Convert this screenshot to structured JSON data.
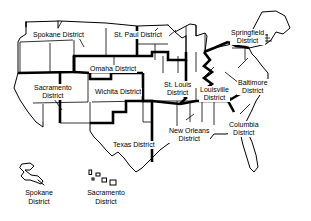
{
  "map": {
    "title": "US Army Corps of Engineers District Map",
    "colors": {
      "outline": "#000000",
      "district_boundary": "#000000",
      "state_boundary": "#000000",
      "background": "#ffffff"
    },
    "districts": [
      {
        "id": "spokane",
        "name": "Spokane District",
        "label_lines": [
          "Spokane District"
        ],
        "label_x": 32,
        "label_y": 31,
        "leader": true
      },
      {
        "id": "st-paul",
        "name": "St. Paul District",
        "label_lines": [
          "St. Paul District"
        ],
        "label_x": 113,
        "label_y": 31,
        "leader": true
      },
      {
        "id": "springfield",
        "name": "Springfield District",
        "label_lines": [
          "Springfield",
          "District"
        ],
        "label_x": 230,
        "label_y": 29,
        "leader": true
      },
      {
        "id": "omaha",
        "name": "Omaha District",
        "label_lines": [
          "Omaha District"
        ],
        "label_x": 89,
        "label_y": 65,
        "leader": false
      },
      {
        "id": "sacramento",
        "name": "Sacramento District",
        "label_lines": [
          "Sacramento",
          "District"
        ],
        "label_x": 33,
        "label_y": 84,
        "leader": true
      },
      {
        "id": "wichita",
        "name": "Wichita District",
        "label_lines": [
          "Wichita District"
        ],
        "label_x": 94,
        "label_y": 88,
        "leader": false
      },
      {
        "id": "st-louis",
        "name": "St. Louis District",
        "label_lines": [
          "St. Louis",
          "District"
        ],
        "label_x": 163,
        "label_y": 81,
        "leader": true
      },
      {
        "id": "louisville",
        "name": "Louisville District",
        "label_lines": [
          "Louisville",
          "District"
        ],
        "label_x": 199,
        "label_y": 86,
        "leader": true
      },
      {
        "id": "baltimore",
        "name": "Baltimore District",
        "label_lines": [
          "Baltimore",
          "District"
        ],
        "label_x": 237,
        "label_y": 79,
        "leader": true
      },
      {
        "id": "columbia",
        "name": "Columbia District",
        "label_lines": [
          "Columbia",
          "District"
        ],
        "label_x": 228,
        "label_y": 121,
        "leader": true
      },
      {
        "id": "texas",
        "name": "Texas District",
        "label_lines": [
          "Texas District"
        ],
        "label_x": 112,
        "label_y": 141,
        "leader": false
      },
      {
        "id": "new-orleans",
        "name": "New Orleans District",
        "label_lines": [
          "New Orleans",
          "District"
        ],
        "label_x": 168,
        "label_y": 127,
        "leader": true
      }
    ],
    "insets": [
      {
        "id": "alaska-inset",
        "name": "Alaska inset",
        "assigned_district": "Spokane District",
        "label_lines": [
          "Spokane",
          "District"
        ],
        "label_x": 18,
        "label_y": 190
      },
      {
        "id": "hawaii-inset",
        "name": "Hawaii inset",
        "assigned_district": "Sacramento District",
        "label_lines": [
          "Sacramento",
          "District"
        ],
        "label_x": 80,
        "label_y": 190
      }
    ]
  }
}
